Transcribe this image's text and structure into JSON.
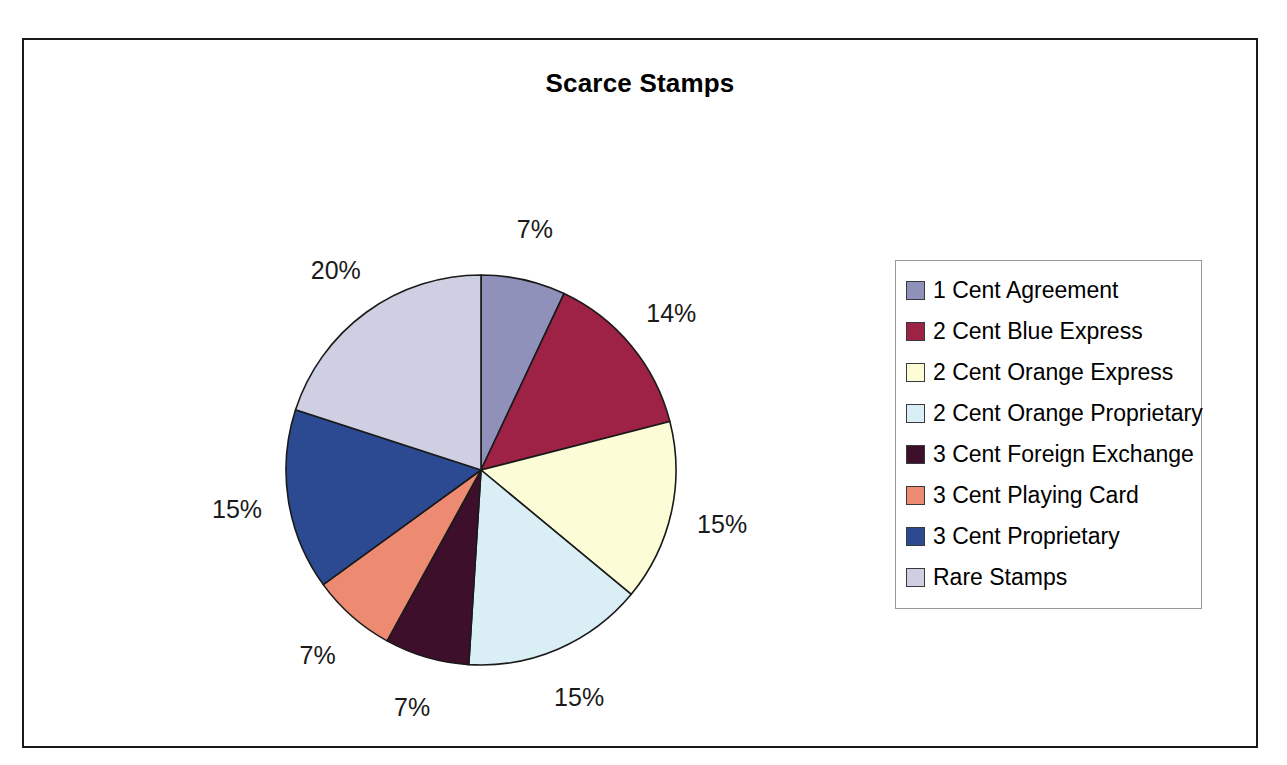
{
  "chart_data": {
    "type": "pie",
    "title": "Scarce Stamps",
    "xlabel": "",
    "ylabel": "",
    "legend_position": "right",
    "grid": false,
    "categories": [
      "1 Cent Agreement",
      "2 Cent Blue Express",
      "2 Cent Orange Express",
      "2 Cent Orange Proprietary",
      "3 Cent Foreign Exchange",
      "3 Cent Playing Card",
      "3 Cent Proprietary",
      "Rare Stamps"
    ],
    "values": [
      7,
      14,
      15,
      15,
      7,
      7,
      15,
      20
    ],
    "value_labels": [
      "7%",
      "14%",
      "15%",
      "15%",
      "7%",
      "7%",
      "15%",
      "20%"
    ],
    "colors": [
      "#9091bb",
      "#9e2245",
      "#fcfcd6",
      "#daeef6",
      "#3d0f2b",
      "#ec8a72",
      "#2c4a92",
      "#cfcfe3"
    ],
    "slice_border_color": "#1a1a1a",
    "start_angle_deg": 0,
    "direction": "clockwise"
  },
  "legend": {
    "items": [
      {
        "label": "1 Cent Agreement",
        "color": "#9091bb"
      },
      {
        "label": "2 Cent Blue Express",
        "color": "#9e2245"
      },
      {
        "label": "2 Cent Orange Express",
        "color": "#fcfcd6"
      },
      {
        "label": "2 Cent Orange Proprietary",
        "color": "#daeef6"
      },
      {
        "label": "3 Cent Foreign Exchange",
        "color": "#3d0f2b"
      },
      {
        "label": "3 Cent Playing Card",
        "color": "#ec8a72"
      },
      {
        "label": "3 Cent Proprietary",
        "color": "#2c4a92"
      },
      {
        "label": "Rare Stamps",
        "color": "#cfcfe3"
      }
    ]
  }
}
